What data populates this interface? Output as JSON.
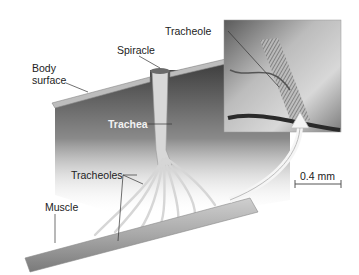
{
  "figure": {
    "labels": {
      "body_surface": "Body\nsurface",
      "body_surface_line1": "Body",
      "body_surface_line2": "surface",
      "spiracle": "Spiracle",
      "trachea": "Trachea",
      "tracheoles": "Tracheoles",
      "muscle": "Muscle",
      "tracheole": "Tracheole"
    },
    "scale_bar": {
      "label": "0.4 mm"
    },
    "inset": {
      "type": "micrograph",
      "caption_label": "Tracheole"
    },
    "colors": {
      "tissue_dark": "#3a3a3a",
      "tissue_light": "#bdbdbd",
      "tube": "#d9d9d9",
      "label_text": "#222222"
    }
  }
}
